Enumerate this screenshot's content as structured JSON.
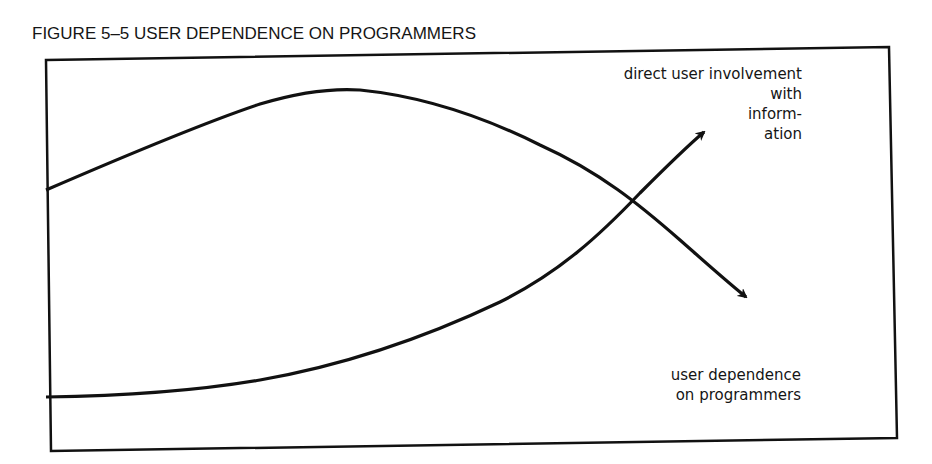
{
  "figure": {
    "title": "FIGURE 5–5  USER DEPENDENCE ON PROGRAMMERS"
  },
  "labels": {
    "direct_involvement": [
      "direct user involvement",
      "with",
      "inform-",
      "ation"
    ],
    "user_dependence": [
      "user dependence",
      "on programmers"
    ]
  },
  "colors": {
    "ink": "#111111",
    "background": "#ffffff"
  },
  "curves": [
    {
      "name": "user dependence on programmers",
      "shape": "rises to a peak then falls, ending with downward arrow",
      "start": [
        46,
        190
      ],
      "peak": [
        335,
        90
      ],
      "crossing": [
        630,
        200
      ],
      "arrow_tip": [
        748,
        298
      ]
    },
    {
      "name": "direct user involvement with information",
      "shape": "flat at start then rises, ending with upward arrow",
      "start": [
        46,
        397
      ],
      "crossing": [
        630,
        200
      ],
      "arrow_tip": [
        706,
        130
      ]
    }
  ]
}
